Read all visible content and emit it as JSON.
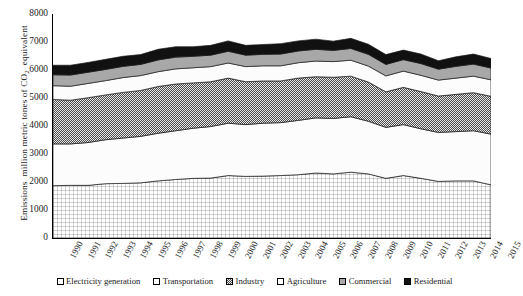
{
  "chart_data": {
    "type": "area",
    "title": "",
    "subtitle": "",
    "xlabel": "",
    "ylabel": "Emissions  million metric tones of CO₂  equivalent",
    "ylabel_plain": "Emissions million metric tones of CO2 equivalent",
    "stacked": true,
    "grid": false,
    "legend_position": "bottom",
    "xlim": [
      1990,
      2015
    ],
    "ylim": [
      0,
      8000
    ],
    "ytick_step": 1000,
    "yticks": [
      0,
      1000,
      2000,
      3000,
      4000,
      5000,
      6000,
      7000,
      8000
    ],
    "ytick_labels": [
      "0",
      "1000",
      "2000",
      "3000",
      "4000",
      "5000",
      "6000",
      "7000",
      "8000"
    ],
    "categories": [
      "1990",
      "1991",
      "1992",
      "1993",
      "1994",
      "1995",
      "1996",
      "1997",
      "1998",
      "1999",
      "2000",
      "2001",
      "2002",
      "2003",
      "2004",
      "2005",
      "2006",
      "2007",
      "2008",
      "2009",
      "2010",
      "2011",
      "2012",
      "2013",
      "2014",
      "2015"
    ],
    "series": [
      {
        "name": "Electricity generation",
        "pattern": "fine-grid",
        "color": "#ffffff",
        "values": [
          1870,
          1880,
          1880,
          1940,
          1950,
          1970,
          2040,
          2090,
          2130,
          2140,
          2230,
          2200,
          2210,
          2230,
          2260,
          2320,
          2290,
          2350,
          2290,
          2130,
          2230,
          2130,
          2020,
          2040,
          2040,
          1900
        ]
      },
      {
        "name": "Transportation",
        "pattern": "solid-white",
        "color": "#fbfbfb",
        "values": [
          1490,
          1480,
          1530,
          1570,
          1620,
          1660,
          1700,
          1740,
          1790,
          1840,
          1870,
          1850,
          1890,
          1890,
          1940,
          1970,
          1980,
          1980,
          1880,
          1820,
          1820,
          1770,
          1750,
          1760,
          1790,
          1810
        ]
      },
      {
        "name": "Industry",
        "pattern": "checker",
        "color": "#7d7d7d",
        "values": [
          1590,
          1560,
          1600,
          1600,
          1630,
          1640,
          1670,
          1670,
          1620,
          1600,
          1610,
          1530,
          1510,
          1490,
          1510,
          1470,
          1470,
          1450,
          1400,
          1270,
          1330,
          1330,
          1300,
          1330,
          1360,
          1350
        ]
      },
      {
        "name": "Agriculture",
        "pattern": "solid-white",
        "color": "#fdfdfd",
        "values": [
          490,
          500,
          510,
          510,
          530,
          530,
          530,
          540,
          540,
          540,
          540,
          540,
          540,
          540,
          550,
          560,
          560,
          570,
          570,
          570,
          580,
          580,
          570,
          580,
          590,
          590
        ]
      },
      {
        "name": "Commercial",
        "pattern": "gray",
        "color": "#a8a8a8",
        "values": [
          390,
          400,
          400,
          400,
          400,
          400,
          420,
          420,
          410,
          410,
          420,
          410,
          410,
          420,
          420,
          420,
          400,
          420,
          420,
          410,
          410,
          420,
          390,
          420,
          430,
          420
        ]
      },
      {
        "name": "Residential",
        "pattern": "black",
        "color": "#111111",
        "values": [
          340,
          350,
          350,
          360,
          360,
          350,
          380,
          370,
          340,
          350,
          370,
          350,
          350,
          370,
          360,
          360,
          330,
          360,
          360,
          350,
          340,
          340,
          300,
          340,
          360,
          340
        ]
      }
    ],
    "series_totals": [
      6170,
      6170,
      6270,
      6380,
      6490,
      6550,
      6740,
      6830,
      6830,
      6880,
      7040,
      6880,
      6910,
      6940,
      7040,
      7100,
      7030,
      7130,
      6920,
      6550,
      6710,
      6570,
      6330,
      6470,
      6570,
      6410
    ]
  },
  "legend": {
    "items": [
      {
        "label": "Electricity generation",
        "swatch": "fine-grid-swatch"
      },
      {
        "label": "Transportation",
        "swatch": "empty-swatch"
      },
      {
        "label": "Industry",
        "swatch": "checker-swatch"
      },
      {
        "label": "Agriculture",
        "swatch": "empty-swatch"
      },
      {
        "label": "Commercial",
        "swatch": "gray-swatch"
      },
      {
        "label": "Residential",
        "swatch": "black-swatch"
      }
    ]
  },
  "colors": {
    "axis": "#000000",
    "text": "#1a1a1a",
    "background": "#ffffff",
    "electricity_generation": "#ffffff",
    "transportation": "#fbfbfb",
    "industry": "#7d7d7d",
    "agriculture": "#fdfdfd",
    "commercial": "#a8a8a8",
    "residential": "#111111"
  }
}
